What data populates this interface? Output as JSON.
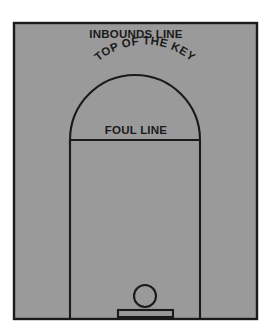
{
  "diagram": {
    "labels": {
      "inbounds": "INBOUNDS LINE",
      "top_of_key": "TOP OF THE KEY",
      "foul_line": "FOUL LINE"
    },
    "colors": {
      "court_fill": "#9a9a9a",
      "line_color": "#1a1a1a",
      "page_background": "#ffffff",
      "text_color": "#1a1a1a"
    },
    "geometry": {
      "court_x": 13,
      "court_y": 22,
      "court_width": 245,
      "court_height": 298,
      "lane_left_x": 70,
      "lane_right_x": 200,
      "foul_line_y": 140,
      "key_arc_radius": 65,
      "key_arc_apex_y": 79,
      "rim_center_x": 145,
      "rim_center_y": 296,
      "rim_radius": 11,
      "backboard_x": 118,
      "backboard_y": 310,
      "backboard_width": 55,
      "backboard_height": 7,
      "border_width": 2
    },
    "elements": {
      "court_outline": "court-outline",
      "key_arc": "key-arc",
      "foul_line": "foul-line",
      "lane_left": "lane-left-line",
      "lane_right": "lane-right-line",
      "rim": "basketball-rim",
      "backboard": "backboard"
    }
  }
}
